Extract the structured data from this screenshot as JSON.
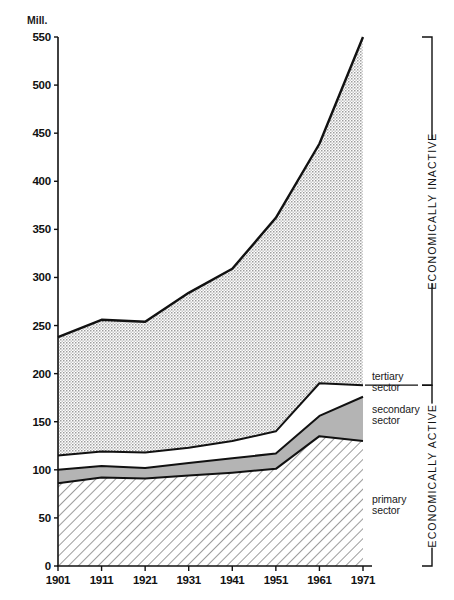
{
  "chart_data": {
    "type": "area",
    "title": "",
    "subtitle": "",
    "xlabel": "",
    "ylabel": "Mill.",
    "unit_label": "Mill.",
    "grid": false,
    "legend_position": "right-inline",
    "stacked": true,
    "categories": [
      "1901",
      "1911",
      "1921",
      "1931",
      "1941",
      "1951",
      "1961",
      "1971"
    ],
    "x": [
      1901,
      1911,
      1921,
      1931,
      1941,
      1951,
      1961,
      1971
    ],
    "xlim": [
      1901,
      1971
    ],
    "ylim": [
      0,
      550
    ],
    "yticks": [
      0,
      50,
      100,
      150,
      200,
      250,
      300,
      350,
      400,
      450,
      500,
      550
    ],
    "series": [
      {
        "name": "primary sector",
        "label": "primary sector",
        "fill": "diagonal-hatch",
        "color": "#ffffff",
        "values": [
          86,
          92,
          91,
          94,
          97,
          101,
          135,
          130
        ]
      },
      {
        "name": "secondary sector",
        "label": "secondary sector",
        "fill": "solid-gray",
        "color": "#b5b5b5",
        "values": [
          14,
          12,
          11,
          13,
          15,
          16,
          21,
          46
        ]
      },
      {
        "name": "tertiary sector",
        "label": "tertiary sector",
        "fill": "white",
        "color": "#ffffff",
        "values": [
          15,
          15,
          16,
          16,
          18,
          23,
          34,
          12
        ]
      },
      {
        "name": "economically inactive",
        "label": "economically inactive",
        "fill": "stipple-dots",
        "color": "#dcdcdc",
        "values": [
          123,
          137,
          136,
          161,
          179,
          222,
          249,
          362
        ]
      }
    ],
    "cumulative_tops": {
      "primary": [
        86,
        92,
        91,
        94,
        97,
        101,
        135,
        130
      ],
      "secondary": [
        100,
        104,
        102,
        107,
        112,
        117,
        156,
        176
      ],
      "tertiary": [
        115,
        119,
        118,
        123,
        130,
        140,
        190,
        188
      ],
      "total": [
        238,
        256,
        254,
        284,
        309,
        362,
        439,
        550
      ]
    },
    "annotations": [
      {
        "name": "economically-inactive-bracket",
        "text": "ECONOMICALLY INACTIVE",
        "from": 188,
        "to": 550
      },
      {
        "name": "economically-active-bracket",
        "text": "ECONOMICALLY ACTIVE",
        "from": 0,
        "to": 188
      }
    ]
  },
  "axis": {
    "unit": "Mill.",
    "y_ticks": [
      "550",
      "500",
      "450",
      "400",
      "350",
      "300",
      "250",
      "200",
      "150",
      "100",
      "50",
      "0"
    ],
    "x_ticks": [
      "1901",
      "1911",
      "1921",
      "1931",
      "1941",
      "1951",
      "1961",
      "1971"
    ]
  },
  "sector_labels": {
    "tertiary_line1": "tertiary",
    "tertiary_line2": "sector",
    "secondary_line1": "secondary",
    "secondary_line2": "sector",
    "primary_line1": "primary",
    "primary_line2": "sector"
  },
  "bracket_labels": {
    "inactive": "ECONOMICALLY INACTIVE",
    "active": "ECONOMICALLY ACTIVE"
  },
  "colors": {
    "ink": "#111111",
    "stipple": "#dedede",
    "secondary_gray": "#b4b4b4",
    "background": "#ffffff"
  }
}
